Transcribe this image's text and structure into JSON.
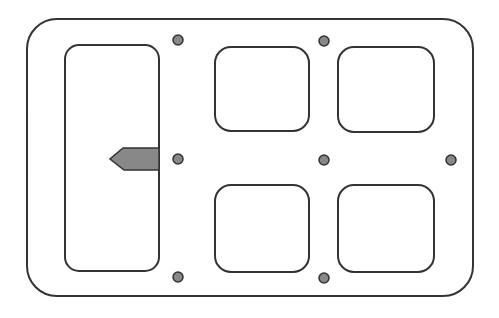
{
  "diagram": {
    "type": "panel-layout",
    "canvas": {
      "width": 499,
      "height": 318,
      "background": "#ffffff"
    },
    "colors": {
      "stroke": "#333333",
      "dot_fill": "#888888",
      "arrow_fill": "#888888"
    },
    "outer_frame": {
      "x": 27,
      "y": 19,
      "width": 446,
      "height": 277,
      "radius": 30
    },
    "left_panel": {
      "x": 65,
      "y": 45,
      "width": 94,
      "height": 226,
      "radius": 14
    },
    "squares": [
      {
        "id": "top-left",
        "x": 215,
        "y": 47,
        "width": 94,
        "height": 84,
        "radius": 16
      },
      {
        "id": "top-right",
        "x": 338,
        "y": 47,
        "width": 96,
        "height": 85,
        "radius": 16
      },
      {
        "id": "bottom-left",
        "x": 215,
        "y": 185,
        "width": 94,
        "height": 87,
        "radius": 16
      },
      {
        "id": "bottom-right",
        "x": 338,
        "y": 185,
        "width": 96,
        "height": 87,
        "radius": 16
      }
    ],
    "dots": [
      {
        "cx": 178,
        "cy": 40,
        "r": 5
      },
      {
        "cx": 324,
        "cy": 41,
        "r": 5
      },
      {
        "cx": 178,
        "cy": 159,
        "r": 5
      },
      {
        "cx": 324,
        "cy": 160,
        "r": 5
      },
      {
        "cx": 451,
        "cy": 160,
        "r": 5
      },
      {
        "cx": 178,
        "cy": 277,
        "r": 5
      },
      {
        "cx": 324,
        "cy": 278,
        "r": 5
      }
    ],
    "arrow": {
      "direction": "left",
      "points": "159,148 123,148 110,159 124,170 159,170"
    }
  }
}
